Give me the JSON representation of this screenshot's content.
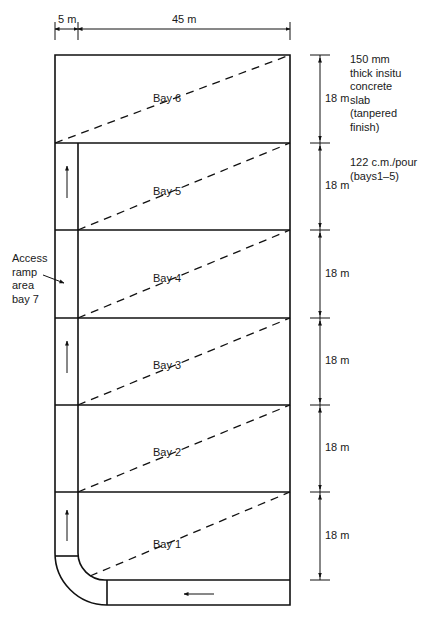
{
  "dimensions": {
    "ramp_width": "5 m",
    "bay_width": "45 m",
    "bay_length": "18 m"
  },
  "bays": [
    {
      "label": "Bay 6"
    },
    {
      "label": "Bay 5"
    },
    {
      "label": "Bay 4"
    },
    {
      "label": "Bay 3"
    },
    {
      "label": "Bay 2"
    },
    {
      "label": "Bay 1"
    }
  ],
  "bay_dimension_labels": [
    "18 m",
    "18 m",
    "18 m",
    "18 m",
    "18 m",
    "18 m"
  ],
  "notes": {
    "slab": [
      "150 mm",
      "thick insitu",
      "concrete",
      "slab",
      "(tanpered",
      "finish)"
    ],
    "pour": [
      "122 c.m./pour",
      "(bays1–5)"
    ]
  },
  "ramp_callout": [
    "Access",
    "ramp",
    "area",
    "bay 7"
  ],
  "colors": {
    "line": "#111111",
    "background": "#ffffff"
  }
}
